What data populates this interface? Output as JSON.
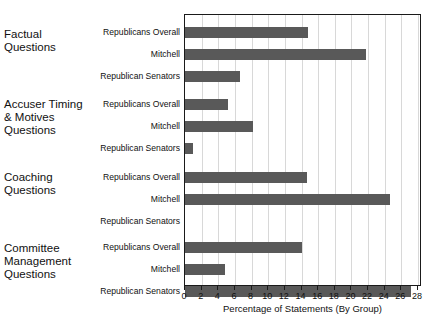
{
  "chart_data": {
    "type": "bar",
    "orientation": "horizontal",
    "title": "",
    "xlabel": "Percentage of Statements (By Group)",
    "ylabel": "",
    "xlim": [
      0,
      28
    ],
    "xticks": [
      0,
      2,
      4,
      6,
      8,
      10,
      12,
      14,
      16,
      18,
      20,
      22,
      24,
      26,
      28
    ],
    "grid": "vertical",
    "legend": "none",
    "bar_color": "#595959",
    "series_names": [
      "Republicans Overall",
      "Mitchell",
      "Republican Senators"
    ],
    "groups": [
      {
        "label": "Factual\nQuestions",
        "label_lines": [
          "Factual",
          "Questions"
        ],
        "bars": [
          {
            "series": "Republicans Overall",
            "value": 14.8
          },
          {
            "series": "Mitchell",
            "value": 21.8
          },
          {
            "series": "Republican Senators",
            "value": 6.6
          }
        ]
      },
      {
        "label": "Accuser Timing & Motives Questions",
        "label_lines": [
          "Accuser Timing",
          "& Motives",
          "Questions"
        ],
        "bars": [
          {
            "series": "Republicans Overall",
            "value": 5.2
          },
          {
            "series": "Mitchell",
            "value": 8.2
          },
          {
            "series": "Republican Senators",
            "value": 1.0
          }
        ]
      },
      {
        "label": "Coaching Questions",
        "label_lines": [
          "Coaching",
          "Questions"
        ],
        "bars": [
          {
            "series": "Republicans Overall",
            "value": 14.7
          },
          {
            "series": "Mitchell",
            "value": 24.6
          },
          {
            "series": "Republican Senators",
            "value": 0
          }
        ]
      },
      {
        "label": "Committee Management Questions",
        "label_lines": [
          "Committee",
          "Management",
          "Questions"
        ],
        "bars": [
          {
            "series": "Republicans Overall",
            "value": 14.0
          },
          {
            "series": "Mitchell",
            "value": 4.8
          },
          {
            "series": "Republican Senators",
            "value": 27.2
          }
        ]
      }
    ]
  },
  "axis": {
    "x_title": "Percentage of Statements (By Group)",
    "tick_labels": [
      "0",
      "2",
      "4",
      "6",
      "8",
      "10",
      "12",
      "14",
      "16",
      "18",
      "20",
      "22",
      "24",
      "26",
      "28"
    ]
  }
}
